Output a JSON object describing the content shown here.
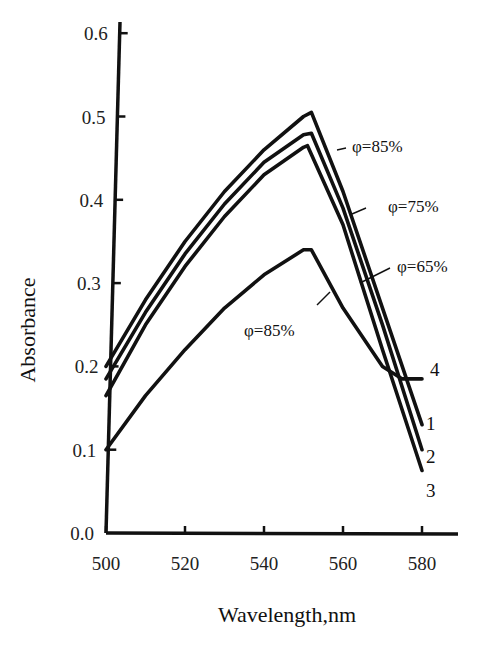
{
  "chart_data": {
    "type": "line",
    "title": "",
    "xlabel": "Wavelength,nm",
    "ylabel": "Absorbance",
    "xlim": [
      500,
      590
    ],
    "ylim": [
      0.0,
      0.6
    ],
    "x_ticks": [
      "500",
      "520",
      "540",
      "560",
      "580"
    ],
    "y_ticks": [
      "0.0",
      "0.1",
      "0.2",
      "0.3",
      "0.4",
      "0.5",
      "0.6"
    ],
    "grid": false,
    "legend": "none (curves labeled inline)",
    "series": [
      {
        "name": "1",
        "annotation": "φ=85%",
        "x": [
          500,
          510,
          520,
          530,
          540,
          550,
          552,
          560,
          570,
          580
        ],
        "y": [
          0.2,
          0.28,
          0.35,
          0.41,
          0.46,
          0.5,
          0.505,
          0.41,
          0.27,
          0.13
        ]
      },
      {
        "name": "2",
        "annotation": "φ=75%",
        "x": [
          500,
          510,
          520,
          530,
          540,
          550,
          552,
          560,
          570,
          580
        ],
        "y": [
          0.185,
          0.265,
          0.335,
          0.395,
          0.445,
          0.478,
          0.48,
          0.39,
          0.25,
          0.1
        ]
      },
      {
        "name": "3",
        "annotation": "φ=65%",
        "x": [
          500,
          510,
          520,
          530,
          540,
          550,
          551,
          560,
          570,
          580
        ],
        "y": [
          0.165,
          0.25,
          0.32,
          0.38,
          0.43,
          0.463,
          0.465,
          0.37,
          0.22,
          0.075
        ]
      },
      {
        "name": "4",
        "annotation": "φ=85%",
        "x": [
          500,
          510,
          520,
          530,
          540,
          550,
          552,
          560,
          570,
          575,
          580
        ],
        "y": [
          0.1,
          0.165,
          0.22,
          0.27,
          0.31,
          0.34,
          0.34,
          0.27,
          0.2,
          0.185,
          0.185
        ]
      }
    ]
  },
  "labels": {
    "y_axis_title": "Absorbance",
    "x_axis_title": "Wavelength,nm",
    "annotations": [
      "φ=85%",
      "φ=75%",
      "φ=65%",
      "φ=85%"
    ],
    "curve_numbers": [
      "1",
      "2",
      "3",
      "4"
    ]
  }
}
